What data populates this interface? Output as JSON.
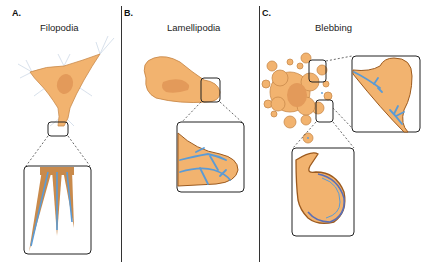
{
  "figure": {
    "panels": [
      {
        "letter": "A.",
        "title": "Filopodia"
      },
      {
        "letter": "B.",
        "title": "Lamellipodia"
      },
      {
        "letter": "C.",
        "title": "Blebbing"
      }
    ],
    "colors": {
      "cell_fill": "#F2B36F",
      "cell_stroke": "#C98A4B",
      "nucleus_fill": "#E39A5A",
      "membrane_dark": "#9C5A1E",
      "actin_blue": "#5B9BD5",
      "frame_stroke": "#222222"
    }
  }
}
